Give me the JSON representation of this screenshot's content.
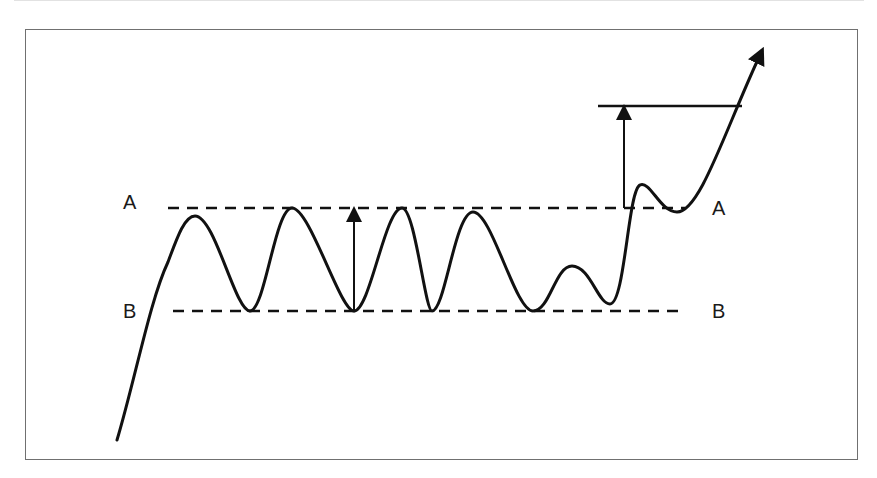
{
  "diagram": {
    "type": "price-pattern",
    "levels": [
      {
        "name": "A",
        "role": "resistance",
        "y": 208
      },
      {
        "name": "B",
        "role": "support",
        "y": 311
      }
    ],
    "labels": {
      "left_a": "A",
      "left_b": "B",
      "right_a": "A",
      "right_b": "B"
    },
    "colors": {
      "line": "#111111",
      "frame": "#707070"
    },
    "price_path": "M117,440 C135,380 150,300 168,262 C178,235 185,216 195,216 C215,216 235,311 250,311 C265,311 275,208 292,208 C310,208 340,311 354,311 C370,311 385,208 402,208 C415,208 425,311 432,311 C445,311 455,212 473,212 C492,212 515,311 533,311 C550,311 555,266 572,266 C590,266 598,304 610,304 C625,304 628,190 640,185 C650,180 660,212 677,212 C700,212 725,130 760,55",
    "arrows": [
      {
        "name": "range-height-arrow",
        "x": 354,
        "y_from": 311,
        "y_to": 208
      },
      {
        "name": "breakout-target-arrow",
        "x": 624,
        "y_from": 208,
        "y_to": 106
      }
    ],
    "target_line": {
      "x1": 598,
      "x2": 742,
      "y": 106
    }
  }
}
